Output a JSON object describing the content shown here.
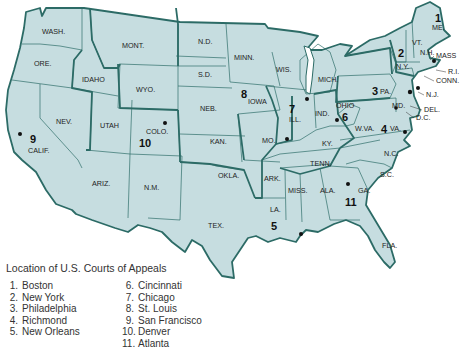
{
  "legend": {
    "title": "Location of U.S. Courts of Appeals",
    "items": [
      {
        "num": "1.",
        "city": "Boston"
      },
      {
        "num": "2.",
        "city": "New York"
      },
      {
        "num": "3.",
        "city": "Philadelphia"
      },
      {
        "num": "4.",
        "city": "Richmond"
      },
      {
        "num": "5.",
        "city": "New Orleans"
      },
      {
        "num": "6.",
        "city": "Cincinnati"
      },
      {
        "num": "7.",
        "city": "Chicago"
      },
      {
        "num": "8.",
        "city": "St. Louis"
      },
      {
        "num": "9.",
        "city": "San Francisco"
      },
      {
        "num": "10.",
        "city": "Denver"
      },
      {
        "num": "11.",
        "city": "Atlanta"
      }
    ]
  },
  "states": {
    "wash": "WASH.",
    "ore": "ORE.",
    "idaho": "IDAHO",
    "mont": "MONT.",
    "wyo": "WYO.",
    "nev": "NEV.",
    "utah": "UTAH",
    "colo": "COLO.",
    "calif": "CALIF.",
    "ariz": "ARIZ.",
    "nm": "N.M.",
    "nd": "N.D.",
    "sd": "S.D.",
    "neb": "NEB.",
    "kan": "KAN.",
    "okla": "OKLA.",
    "tex": "TEX.",
    "minn": "MINN.",
    "iowa": "IOWA",
    "mo": "MO.",
    "ark": "ARK.",
    "la": "LA.",
    "wis": "WIS.",
    "ill": "ILL.",
    "ind": "IND.",
    "mich": "MICH.",
    "ohio": "OHIO",
    "ky": "KY.",
    "tenn": "TENN.",
    "miss": "MISS.",
    "ala": "ALA.",
    "ga": "GA.",
    "fla": "FLA.",
    "sc": "S.C.",
    "nc": "N.C.",
    "va": "VA.",
    "wva": "W.VA.",
    "md": "MD.",
    "del": "DEL.",
    "dc": "D.C.",
    "pa": "PA.",
    "nj": "N.J.",
    "ny": "N.Y.",
    "conn": "CONN.",
    "ri": "R.I.",
    "mass": "MASS",
    "vt": "VT.",
    "nh": "N.H.",
    "me": "ME."
  },
  "circuits": {
    "c1": "1",
    "c2": "2",
    "c3": "3",
    "c4": "4",
    "c5": "5",
    "c6": "6",
    "c7": "7",
    "c8": "8",
    "c9": "9",
    "c10": "10",
    "c11": "11"
  },
  "colors": {
    "land": "#c6dde0",
    "border": "#2c6b66",
    "background": "#ffffff"
  }
}
